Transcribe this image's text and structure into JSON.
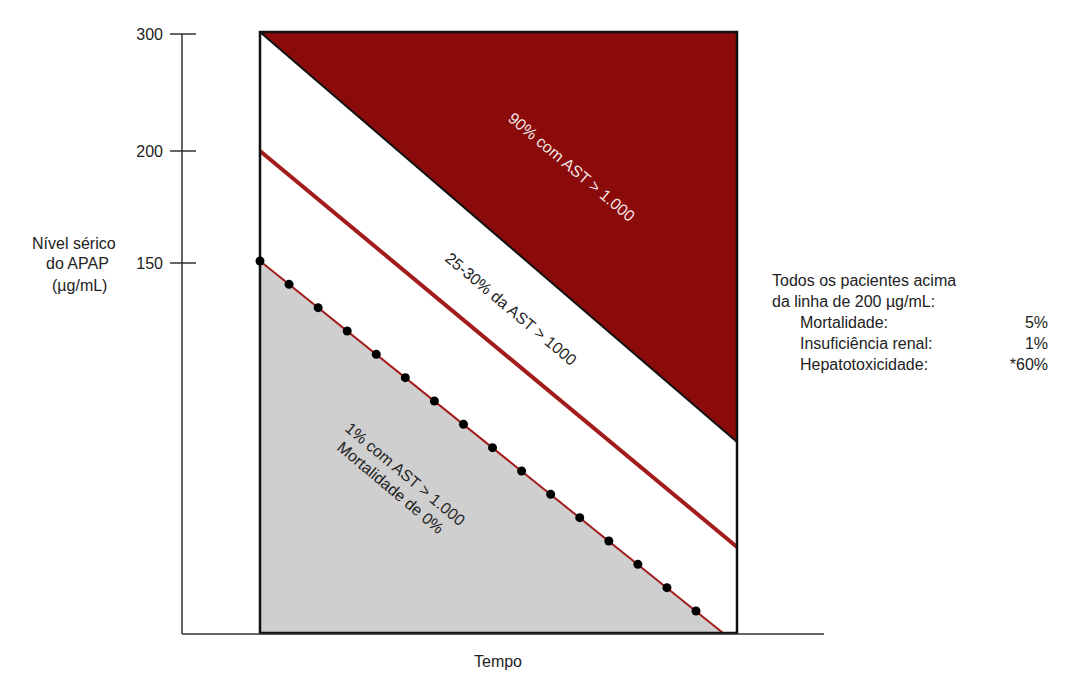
{
  "chart_data": {
    "type": "area",
    "title": "",
    "xlabel": "Tempo",
    "ylabel": [
      "Nível sérico",
      "do APAP",
      "(µg/mL)"
    ],
    "yticks": [
      150,
      200,
      300
    ],
    "ylim": [
      0,
      300
    ],
    "grid": false,
    "colors": {
      "high_risk": "#8b0a0a",
      "line_200": "#a31c1c",
      "low_region": "#cfcfcf",
      "nomogram_line": "#a31c1c",
      "dots": "#000000"
    },
    "regions": [
      {
        "name": "high",
        "label": "90% com AST > 1.000",
        "start_level": 300
      },
      {
        "name": "middle",
        "label": "25-30% da AST > 1000",
        "start_level": 200
      },
      {
        "name": "low",
        "label_line1": "1% com AST > 1.000",
        "label_line2": "Mortalidade de 0%",
        "start_level": 150
      }
    ],
    "lines": [
      {
        "name": "Limite superior (300)",
        "x": [
          0,
          1
        ],
        "y": [
          300,
          "declining"
        ]
      },
      {
        "name": "Linha de 200 µg/mL",
        "start": 200
      },
      {
        "name": "Linha de 150 µg/mL (pontilhada)",
        "start": 150,
        "markers": 16
      }
    ]
  },
  "axis": {
    "tick_300": "300",
    "tick_200": "200",
    "tick_150": "150",
    "ylabel_line1": "Nível sérico",
    "ylabel_line2": "do APAP",
    "ylabel_line3": "(µg/mL)",
    "xlabel": "Tempo"
  },
  "labels": {
    "high": "90% com AST > 1.000",
    "middle": "25-30% da AST > 1000",
    "low1": "1% com AST > 1.000",
    "low2": "Mortalidade de 0%"
  },
  "side_note": {
    "line1": "Todos os pacientes acima",
    "line2": "da linha de 200 µg/mL:",
    "rows": [
      {
        "key": "Mortalidade:",
        "value": "5%"
      },
      {
        "key": "Insuficiência renal:",
        "value": "1%"
      },
      {
        "key": "Hepatotoxicidade:",
        "value": "*60%"
      }
    ]
  }
}
